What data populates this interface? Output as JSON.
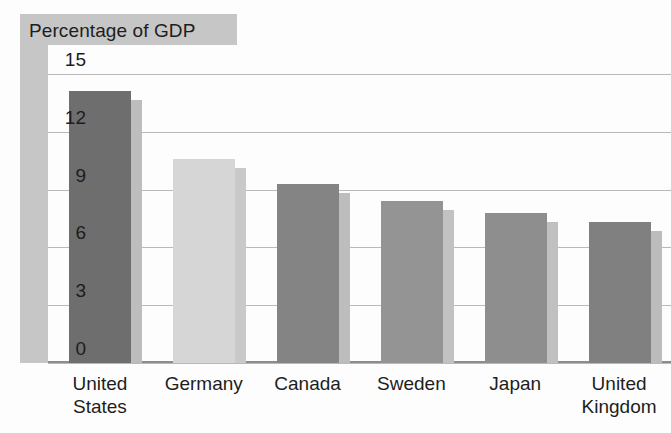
{
  "chart_data": {
    "type": "bar",
    "title": "Percentage of GDP",
    "xlabel": "",
    "ylabel": "",
    "categories": [
      "United States",
      "Germany",
      "Canada",
      "Sweden",
      "Japan",
      "United Kingdom"
    ],
    "category_lines": [
      [
        "United",
        "States"
      ],
      [
        "Germany"
      ],
      [
        "Canada"
      ],
      [
        "Sweden"
      ],
      [
        "Japan"
      ],
      [
        "United",
        "Kingdom"
      ]
    ],
    "values": [
      14.1,
      10.6,
      9.3,
      8.4,
      7.8,
      7.3
    ],
    "series": [
      {
        "name": "Percentage of GDP",
        "values": [
          14.1,
          10.6,
          9.3,
          8.4,
          7.8,
          7.3
        ]
      }
    ],
    "yticks": [
      15,
      12,
      9,
      6,
      3,
      0
    ],
    "ylim": [
      0,
      16.5
    ],
    "grid": true,
    "legend": "none",
    "bar_colors": [
      "#6e6e6e",
      "#d6d6d6",
      "#848484",
      "#949494",
      "#8e8e8e",
      "#808080"
    ],
    "bar_side_colors": [
      "#bdbdbd",
      "#c9c9c9",
      "#bdbdbd",
      "#c2c2c2",
      "#c0c0c0",
      "#bcbcbc"
    ],
    "style": {
      "title_band_color": "#c6c6c6",
      "gridline_color": "#b9b9b9",
      "axis_color": "#8c8c8c",
      "text_color": "#1d1d1d",
      "background": "#fdfdfd"
    }
  }
}
